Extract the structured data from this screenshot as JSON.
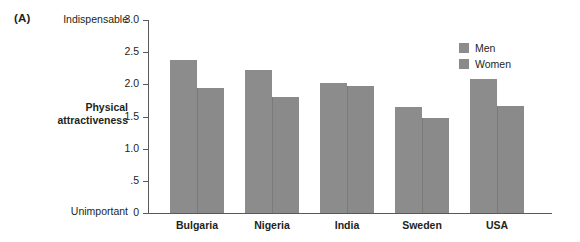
{
  "panel": {
    "label": "(A)"
  },
  "axis": {
    "title_line1": "Physical",
    "title_line2": "attractiveness",
    "anchor_high": "Indispensable",
    "anchor_low": "Unimportant"
  },
  "legend": {
    "items": [
      {
        "label": "Men",
        "color": "#8c8c8c"
      },
      {
        "label": "Women",
        "color": "#8a8a8a"
      }
    ]
  },
  "chart_data": {
    "type": "bar",
    "title": "",
    "xlabel": "",
    "ylabel": "Physical attractiveness",
    "ylim": [
      0,
      3.0
    ],
    "grid": false,
    "legend_position": "top-right",
    "y_anchor_high": "Indispensable",
    "y_anchor_low": "Unimportant",
    "yticks": [
      0,
      0.5,
      1.0,
      1.5,
      2.0,
      2.5,
      3.0
    ],
    "ytick_labels": [
      "0",
      ".5",
      "1.0",
      "1.5",
      "2.0",
      "2.5",
      "3.0"
    ],
    "categories": [
      "Bulgaria",
      "Nigeria",
      "India",
      "Sweden",
      "USA"
    ],
    "series": [
      {
        "name": "Men",
        "color": "#8c8c8c",
        "values": [
          2.38,
          2.23,
          2.02,
          1.65,
          2.08
        ]
      },
      {
        "name": "Women",
        "color": "#8a8a8a",
        "values": [
          1.94,
          1.81,
          1.97,
          1.47,
          1.66
        ]
      }
    ]
  }
}
